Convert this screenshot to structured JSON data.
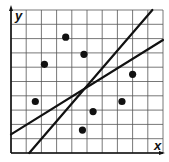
{
  "chart_data": {
    "type": "scatter",
    "title": "",
    "xlabel": "x",
    "ylabel": "y",
    "xlim": [
      0,
      10
    ],
    "ylim": [
      0,
      10
    ],
    "grid": true,
    "grid_step": 1,
    "tick_labels": false,
    "points": [
      {
        "x": 3.6,
        "y": 8.1
      },
      {
        "x": 4.8,
        "y": 6.9
      },
      {
        "x": 2.2,
        "y": 6.2
      },
      {
        "x": 8.0,
        "y": 5.5
      },
      {
        "x": 1.6,
        "y": 3.6
      },
      {
        "x": 7.3,
        "y": 3.6
      },
      {
        "x": 5.4,
        "y": 2.9
      },
      {
        "x": 4.7,
        "y": 1.6
      }
    ],
    "lines": [
      {
        "name": "steep-line",
        "x1": 1.2,
        "y1": 0,
        "x2": 9.3,
        "y2": 10
      },
      {
        "name": "shallow-line",
        "x1": 0,
        "y1": 1.3,
        "x2": 10,
        "y2": 7.9
      }
    ],
    "colors": {
      "grid": "#555555",
      "axis": "#111111",
      "point": "#111111",
      "line": "#111111",
      "background": "#ffffff"
    }
  }
}
